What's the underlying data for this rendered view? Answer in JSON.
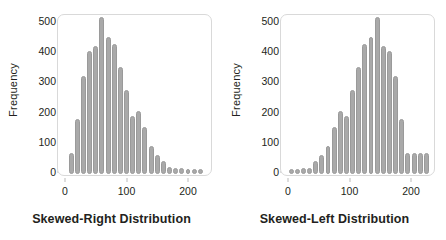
{
  "figure": {
    "background": "#ffffff",
    "bar_color": "#a9a9a9",
    "bar_edge_color": "#9a9a9a",
    "frame_color": "#d9d9d9",
    "text_color": "#231f20"
  },
  "chart_data": [
    {
      "type": "bar",
      "title": "Skewed-Right Distribution",
      "xlabel": "",
      "ylabel": "Frequency",
      "ylim": [
        0,
        530
      ],
      "xlim": [
        -8,
        232
      ],
      "ytick_labels": [
        "0",
        "100",
        "200",
        "300",
        "400",
        "500"
      ],
      "ytick_values": [
        0,
        100,
        200,
        300,
        400,
        500
      ],
      "xtick_labels": [
        "0",
        "100",
        "200"
      ],
      "xtick_values": [
        0,
        100,
        200
      ],
      "grid": false,
      "legend": "none",
      "bin_width": 10,
      "x": [
        10,
        20,
        30,
        40,
        50,
        60,
        70,
        80,
        90,
        100,
        110,
        120,
        130,
        140,
        150,
        160,
        170,
        180,
        190,
        200,
        210,
        220
      ],
      "values": [
        55,
        168,
        310,
        393,
        412,
        505,
        440,
        418,
        340,
        265,
        178,
        196,
        141,
        78,
        50,
        30,
        10,
        8,
        6,
        4,
        3,
        2
      ]
    },
    {
      "type": "bar",
      "title": "Skewed-Left Distribution",
      "xlabel": "",
      "ylabel": "Frequency",
      "ylim": [
        0,
        530
      ],
      "xlim": [
        -8,
        232
      ],
      "ytick_labels": [
        "0",
        "100",
        "200",
        "300",
        "400",
        "500"
      ],
      "ytick_values": [
        0,
        100,
        200,
        300,
        400,
        500
      ],
      "xtick_labels": [
        "0",
        "100",
        "200"
      ],
      "xtick_values": [
        0,
        100,
        200
      ],
      "grid": false,
      "legend": "none",
      "bin_width": 10,
      "x": [
        5,
        15,
        25,
        35,
        45,
        55,
        65,
        75,
        85,
        95,
        105,
        115,
        125,
        135,
        145,
        155,
        165,
        175,
        185,
        195,
        205,
        215,
        225
      ],
      "values": [
        3,
        4,
        5,
        8,
        30,
        50,
        78,
        141,
        196,
        178,
        265,
        340,
        418,
        440,
        505,
        412,
        393,
        310,
        168,
        55,
        55,
        55,
        55
      ]
    }
  ]
}
